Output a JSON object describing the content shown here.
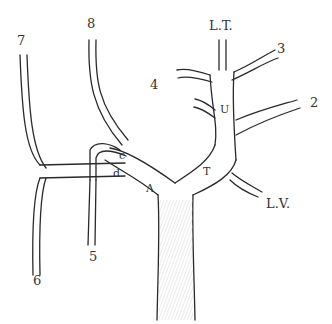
{
  "diagram": {
    "type": "anatomical branching vessel illustration",
    "stroke_color": "#2a2a2a",
    "fill_color": "#ffffff",
    "labels": {
      "lt": "L.T.",
      "n3": "3",
      "n2": "2",
      "n4": "4",
      "u": "U",
      "n8": "8",
      "n7": "7",
      "c": "c",
      "d": "d",
      "a": "Λ",
      "t": "T",
      "lv": "L.V.",
      "n5": "5",
      "n6": "6"
    }
  }
}
